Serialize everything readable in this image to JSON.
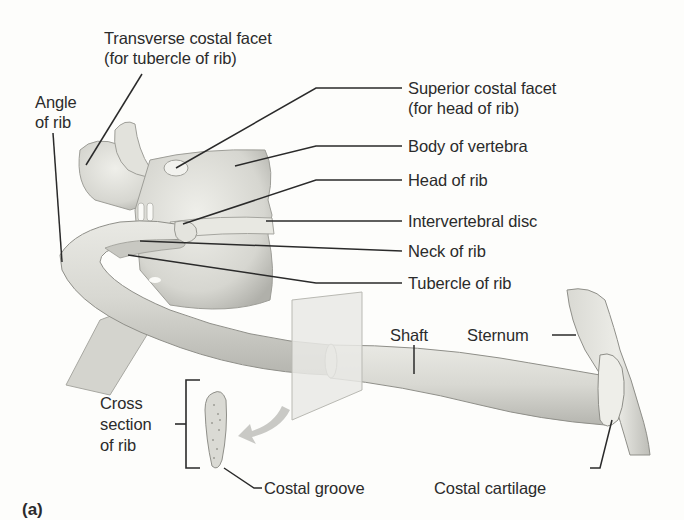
{
  "figure": {
    "panel_label": "(a)"
  },
  "labels": {
    "transverse_costal_facet": {
      "line1": "Transverse costal facet",
      "line2": "(for tubercle of rib)"
    },
    "angle_of_rib": {
      "line1": "Angle",
      "line2": "of rib"
    },
    "superior_costal_facet": {
      "line1": "Superior costal facet",
      "line2": "(for head of rib)"
    },
    "body_of_vertebra": "Body of vertebra",
    "head_of_rib": "Head of rib",
    "intervertebral_disc": "Intervertebral disc",
    "neck_of_rib": "Neck of rib",
    "tubercle_of_rib": "Tubercle of rib",
    "shaft": "Shaft",
    "sternum": "Sternum",
    "cross_section": {
      "line1": "Cross",
      "line2": "section",
      "line3": "of rib"
    },
    "costal_groove": "Costal groove",
    "costal_cartilage": "Costal cartilage"
  },
  "colors": {
    "background": "#fdfdfb",
    "bone_light": "#ececE6",
    "bone_mid": "#d2d2cc",
    "bone_dark": "#a9a9a3",
    "leader_line": "#2a2a2a",
    "plane": "#e6e6e2",
    "arrow": "#c6c6c2"
  }
}
